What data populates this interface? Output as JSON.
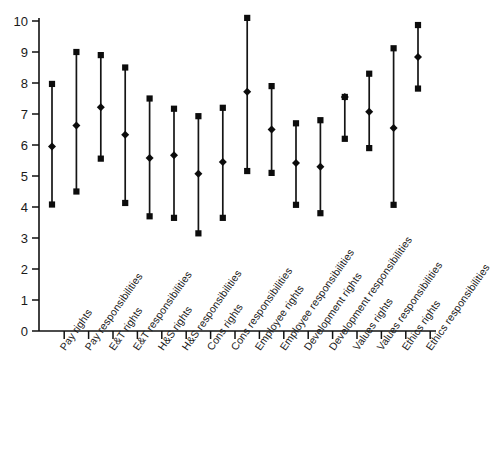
{
  "chart_data": {
    "type": "line",
    "title": "",
    "subtitle": "",
    "xlabel": "",
    "ylabel": "",
    "ylim": [
      0,
      10
    ],
    "yticks": [
      0,
      1,
      2,
      3,
      4,
      5,
      6,
      7,
      8,
      9,
      10
    ],
    "ytick_labels": [
      "0",
      "1",
      "2",
      "3",
      "4",
      "5",
      "6",
      "7",
      "8",
      "9",
      "10"
    ],
    "grid": false,
    "legend": "none",
    "marker_style": {
      "cap": "square",
      "mid": "diamond",
      "color": "#0c0c0c"
    },
    "categories": [
      "Pay rights",
      "Pay responsibilities",
      "E&T rights",
      "E&T responsibilities",
      "H&S rights",
      "H&S responsibilities",
      "Cons rights",
      "Cons responsibilities",
      "Employee rights",
      "Employee responsibilities",
      "Development rights",
      "Development responsibilities",
      "Values rights",
      "Values responsibilities",
      "Ethics rights",
      "Ethics responsibilities"
    ],
    "series": [
      {
        "name": "upper",
        "values": [
          7.97,
          9.0,
          8.9,
          8.5,
          7.5,
          7.17,
          6.93,
          7.2,
          10.1,
          7.9,
          6.7,
          6.8,
          7.55,
          8.3,
          9.12,
          9.87
        ]
      },
      {
        "name": "mean",
        "values": [
          5.95,
          6.63,
          7.22,
          6.33,
          5.58,
          5.67,
          5.07,
          5.45,
          7.72,
          6.5,
          5.42,
          5.3,
          7.55,
          7.07,
          6.55,
          8.84
        ]
      },
      {
        "name": "lower",
        "values": [
          4.08,
          4.5,
          5.56,
          4.13,
          3.7,
          3.65,
          3.15,
          3.65,
          5.16,
          5.1,
          4.07,
          3.8,
          6.2,
          5.9,
          4.07,
          7.82
        ]
      }
    ]
  },
  "axis": {
    "y_axis_name": "value-axis",
    "x_axis_name": "category-axis"
  }
}
